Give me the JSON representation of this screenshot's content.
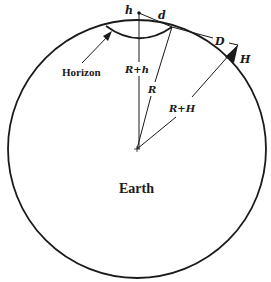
{
  "figure": {
    "labels": {
      "observer_height": "h",
      "horizon_distance": "d",
      "mountain_distance": "D",
      "mountain_height": "H",
      "horizon": "Horizon",
      "observer_radius": "R+h",
      "earth_radius": "R",
      "mountain_radius": "R+H",
      "earth": "Earth"
    },
    "colors": {
      "stroke": "#1a1a1a",
      "background": "#ffffff"
    }
  }
}
